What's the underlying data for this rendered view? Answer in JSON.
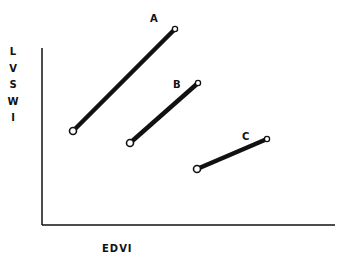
{
  "axes": {
    "y_label_letters": [
      "L",
      "V",
      "S",
      "W",
      "I"
    ],
    "y_label": "LVSWI",
    "x_label": "EDVI"
  },
  "lines": [
    {
      "label": "A",
      "x1": 73,
      "y1": 131,
      "x2": 175,
      "y2": 29,
      "label_x": 150,
      "label_y": 22
    },
    {
      "label": "B",
      "x1": 130,
      "y1": 143,
      "x2": 198,
      "y2": 83,
      "label_x": 173,
      "label_y": 88
    },
    {
      "label": "C",
      "x1": 197,
      "y1": 169,
      "x2": 267,
      "y2": 139,
      "label_x": 242,
      "label_y": 140
    }
  ],
  "colors": {
    "ink": "#111111",
    "background": "#ffffff"
  }
}
